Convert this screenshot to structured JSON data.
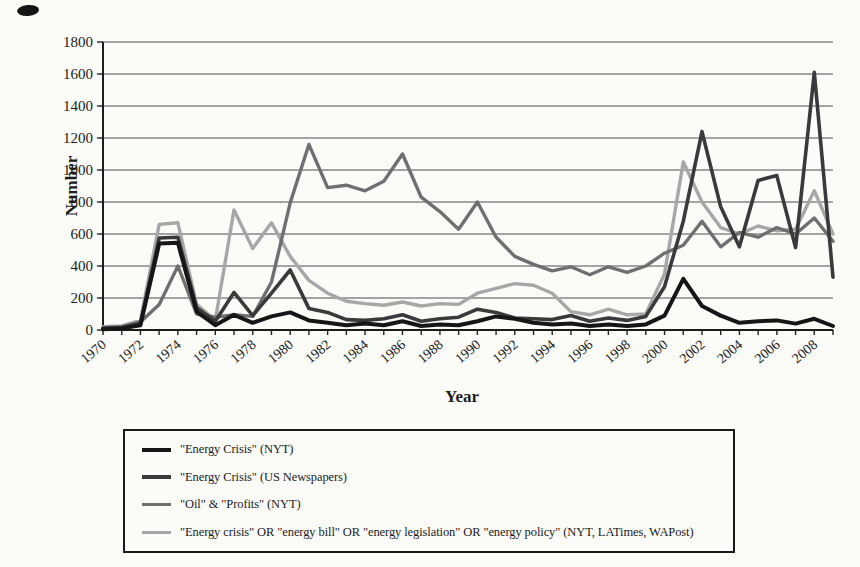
{
  "page": {
    "background": "#fbfbf8",
    "figure_type": "scanned line chart"
  },
  "chart_data": {
    "type": "line",
    "title": "",
    "xlabel": "Year",
    "ylabel": "Number",
    "ylim": [
      0,
      1800
    ],
    "ytick_step": 200,
    "grid": true,
    "legend_position": "bottom-left-box",
    "x_label_every": 2,
    "x": [
      1970,
      1971,
      1972,
      1973,
      1974,
      1975,
      1976,
      1977,
      1978,
      1979,
      1980,
      1981,
      1982,
      1983,
      1984,
      1985,
      1986,
      1987,
      1988,
      1989,
      1990,
      1991,
      1992,
      1993,
      1994,
      1995,
      1996,
      1997,
      1998,
      1999,
      2000,
      2001,
      2002,
      2003,
      2004,
      2005,
      2006,
      2007,
      2008,
      2009
    ],
    "series": [
      {
        "name": "\"Energy Crisis\" (NYT)",
        "color": "#161616",
        "stroke_width": 4,
        "values": [
          5,
          10,
          30,
          540,
          545,
          115,
          30,
          95,
          45,
          85,
          110,
          60,
          45,
          30,
          40,
          30,
          55,
          25,
          35,
          30,
          55,
          85,
          70,
          45,
          35,
          40,
          25,
          35,
          25,
          35,
          90,
          320,
          150,
          90,
          45,
          55,
          60,
          40,
          70,
          25
        ]
      },
      {
        "name": "\"Energy Crisis\" (US Newspapers)",
        "color": "#3a3a3a",
        "stroke_width": 3.6,
        "values": [
          10,
          15,
          40,
          575,
          580,
          140,
          55,
          235,
          90,
          230,
          375,
          135,
          110,
          65,
          60,
          70,
          95,
          55,
          70,
          80,
          130,
          110,
          75,
          70,
          65,
          90,
          55,
          75,
          60,
          85,
          270,
          680,
          1240,
          770,
          520,
          935,
          965,
          515,
          1610,
          330
        ]
      },
      {
        "name": "\"Oil\" & \"Profits\" (NYT)",
        "color": "#6f6f6f",
        "stroke_width": 3.4,
        "values": [
          15,
          20,
          50,
          160,
          400,
          100,
          80,
          95,
          85,
          300,
          795,
          1160,
          890,
          905,
          870,
          930,
          1100,
          830,
          740,
          630,
          800,
          580,
          460,
          410,
          370,
          395,
          345,
          395,
          360,
          400,
          480,
          530,
          680,
          520,
          610,
          580,
          640,
          600,
          700,
          555
        ]
      },
      {
        "name": "\"Energy crisis\" OR \"energy bill\" OR \"energy legislation\" OR \"energy policy\" (NYT, LATimes, WAPost)",
        "color": "#a7a7a7",
        "stroke_width": 3.4,
        "values": [
          20,
          25,
          60,
          660,
          670,
          160,
          60,
          750,
          510,
          670,
          460,
          310,
          230,
          180,
          165,
          155,
          175,
          150,
          165,
          160,
          230,
          260,
          290,
          280,
          230,
          115,
          95,
          130,
          95,
          100,
          350,
          1050,
          800,
          640,
          600,
          650,
          620,
          630,
          870,
          600
        ]
      }
    ]
  }
}
